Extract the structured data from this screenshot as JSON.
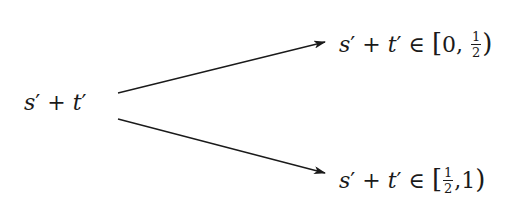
{
  "diagram": {
    "source_node": {
      "label": "s′ + t′",
      "parts": {
        "s": "s",
        "prime1": "′",
        "plus": "+",
        "t": "t",
        "prime2": "′"
      }
    },
    "targets": [
      {
        "label": "s′ + t′ ∈ [0, 1/2)",
        "parts": {
          "s": "s",
          "prime1": "′",
          "plus": "+",
          "t": "t",
          "prime2": "′",
          "in": "∈",
          "open": "[",
          "a": "0,",
          "frac_num": "1",
          "frac_den": "2",
          "close": ")"
        }
      },
      {
        "label": "s′ + t′ ∈ [1/2, 1)",
        "parts": {
          "s": "s",
          "prime1": "′",
          "plus": "+",
          "t": "t",
          "prime2": "′",
          "in": "∈",
          "open": "[",
          "frac_num": "1",
          "frac_den": "2",
          "b": ",1",
          "close": ")"
        }
      }
    ],
    "edges": [
      {
        "from": "source_node",
        "to": "targets.0",
        "x1": 118,
        "y1": 93,
        "x2": 325,
        "y2": 42
      },
      {
        "from": "source_node",
        "to": "targets.1",
        "x1": 118,
        "y1": 119,
        "x2": 325,
        "y2": 173
      }
    ],
    "colors": {
      "ink": "#1a1a1a",
      "background": "#ffffff"
    }
  }
}
